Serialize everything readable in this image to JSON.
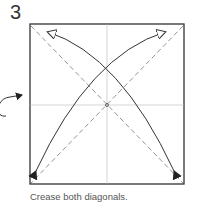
{
  "step": {
    "number": "3"
  },
  "caption": {
    "text": "Crease both diagonals."
  },
  "diagram": {
    "paper": {
      "x": 30,
      "y": 24,
      "size": 154,
      "stroke": "#333333"
    },
    "reference_lines_color": "#bbbbbb",
    "fold_line_color": "#888888",
    "arrow_color": "#333333",
    "icons": [
      "turn-over-icon",
      "valley-fold-arrow-icon",
      "valley-fold-arrow-icon"
    ]
  }
}
